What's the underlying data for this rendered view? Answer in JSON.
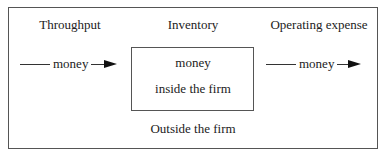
{
  "diagram": {
    "headings": {
      "throughput": "Throughput",
      "inventory": "Inventory",
      "operating_expense": "Operating expense"
    },
    "left_flow": {
      "label": "money"
    },
    "right_flow": {
      "label": "money"
    },
    "inner_box": {
      "line1": "money",
      "line2": "inside the firm"
    },
    "outer_label": "Outside the firm"
  }
}
